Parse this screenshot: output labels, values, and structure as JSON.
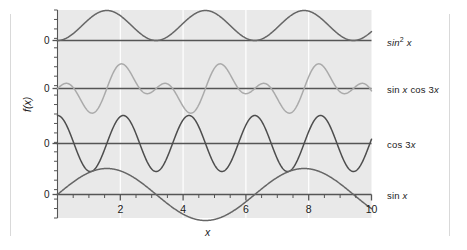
{
  "chart_data": {
    "type": "line",
    "title": "",
    "xlabel": "x",
    "ylabel": "f(x)",
    "xlim": [
      0,
      10
    ],
    "grid": "vertical-major-only",
    "legend_position": "right-of-axes",
    "x_ticks_major": [
      2,
      4,
      6,
      8,
      10
    ],
    "x_ticks_major_labels": [
      "2",
      "4",
      "6",
      "8",
      "10"
    ],
    "x_ticks_minor_step": 0.5,
    "panels": [
      {
        "label": "sin^2 x",
        "label_text": "sin² x",
        "expression": "sin(x)^2",
        "baseline_tick_label": "0",
        "ylim": [
          -0.1,
          1.1
        ],
        "color": "#666666",
        "peaks_at": [
          1.571,
          4.712,
          7.854
        ],
        "zeros_at": [
          0,
          3.142,
          6.283,
          9.425
        ],
        "amplitude": 1,
        "values_sample": [
          0,
          0.708,
          1.0,
          0.708,
          0,
          0.708,
          1.0,
          0.708,
          0,
          0.708,
          1.0
        ]
      },
      {
        "label": "sin x cos 3x",
        "label_text": "sin x cos 3x",
        "expression": "sin(x)*cos(3x)",
        "baseline_tick_label": "0",
        "ylim": [
          -1.05,
          1.05
        ],
        "color": "#aaaaaa",
        "amplitude": 1,
        "values_sample": [
          0,
          0.12,
          -0.55,
          0.78,
          -0.2,
          -0.5,
          0.92,
          -0.45,
          0.25,
          0.7,
          -0.5
        ]
      },
      {
        "label": "cos 3x",
        "label_text": "cos 3x",
        "expression": "cos(3x)",
        "baseline_tick_label": "0",
        "ylim": [
          -1.05,
          1.05
        ],
        "color": "#4d4d4d",
        "period": 2.094,
        "amplitude": 1,
        "values_sample": [
          1,
          -0.99,
          0.96,
          -0.91,
          0.84,
          -0.76,
          0.66,
          -0.54,
          0.42,
          -0.29,
          0.15
        ]
      },
      {
        "label": "sin x",
        "label_text": "sin x",
        "expression": "sin(x)",
        "baseline_tick_label": "0",
        "ylim": [
          -1.05,
          1.05
        ],
        "color": "#666666",
        "period": 6.283,
        "amplitude": 1,
        "zeros_at": [
          0,
          3.142,
          6.283,
          9.425
        ],
        "values_sample": [
          0,
          0.84,
          0.91,
          0.14,
          -0.76,
          -0.96,
          -0.28,
          0.66,
          0.99,
          0.41,
          -0.54
        ]
      }
    ]
  },
  "axis": {
    "y_zero_labels": [
      "0",
      "0",
      "0",
      "0"
    ],
    "x_tick_labels": [
      "2",
      "4",
      "6",
      "8",
      "10"
    ],
    "x_axis_title": "x",
    "y_axis_title": "f(x)"
  },
  "legend": {
    "items": [
      {
        "text": "sin² x",
        "base": "sin",
        "sup": "2",
        "arg": "x"
      },
      {
        "text": "sin x cos 3x"
      },
      {
        "text": "cos 3x"
      },
      {
        "text": "sin x"
      }
    ]
  },
  "colors": {
    "plot_background": "#e9e9e9",
    "gridline": "#ffffff",
    "axis": "#555555",
    "text": "#1a1a1a",
    "curve_dark": "#4d4d4d",
    "curve_mid": "#666666",
    "curve_light": "#aaaaaa",
    "page_frame": "#d9d9d9"
  }
}
